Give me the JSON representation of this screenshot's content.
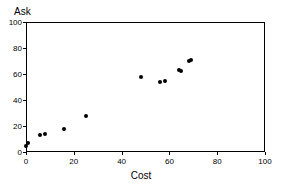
{
  "chart_data": {
    "type": "scatter",
    "title": "",
    "xlabel": "Cost",
    "ylabel": "Ask",
    "xlim": [
      0,
      100
    ],
    "ylim": [
      0,
      100
    ],
    "xticks": [
      0,
      20,
      40,
      60,
      80,
      100
    ],
    "yticks": [
      0,
      20,
      40,
      60,
      80,
      100
    ],
    "xtick_labels": [
      "0",
      "20",
      "40",
      "60",
      "80",
      "100"
    ],
    "ytick_labels": [
      "0",
      "20",
      "40",
      "60",
      "80",
      "100"
    ],
    "grid": false,
    "legend": null,
    "marker": "filled-circle",
    "marker_color": "#000000",
    "points": [
      {
        "x": 0,
        "y": 5
      },
      {
        "x": 1,
        "y": 7
      },
      {
        "x": 6,
        "y": 13
      },
      {
        "x": 8,
        "y": 14
      },
      {
        "x": 16,
        "y": 18
      },
      {
        "x": 25,
        "y": 28
      },
      {
        "x": 48,
        "y": 58
      },
      {
        "x": 56,
        "y": 54
      },
      {
        "x": 58,
        "y": 55
      },
      {
        "x": 64,
        "y": 63
      },
      {
        "x": 65,
        "y": 62
      },
      {
        "x": 68,
        "y": 70
      },
      {
        "x": 69,
        "y": 71
      }
    ]
  },
  "axes": {
    "y_title": "Ask",
    "x_title": "Cost"
  }
}
